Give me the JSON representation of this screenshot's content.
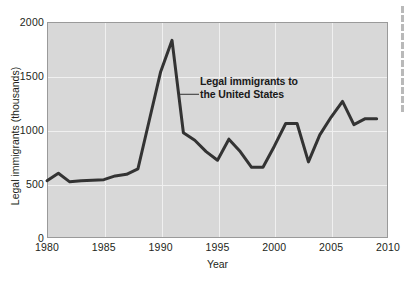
{
  "chart_data": {
    "type": "line",
    "title": "",
    "subtitle": "",
    "xlabel": "Year",
    "ylabel": "Legal immigrants (thousands)",
    "xlim": [
      1980,
      2010
    ],
    "ylim": [
      0,
      2000
    ],
    "grid": true,
    "legend": "none",
    "annotations": [
      {
        "text_line1": "Legal immigrants to",
        "text_line2": "the United States",
        "text": "Legal immigrants to the United States",
        "points_to_x": 1991.7,
        "points_to_y": 1330
      }
    ],
    "xticks": [
      "1980",
      "1985",
      "1990",
      "1995",
      "2000",
      "2005",
      "2010"
    ],
    "xtick_values": [
      1980,
      1985,
      1990,
      1995,
      2000,
      2005,
      2010
    ],
    "yticks": [
      "0",
      "500",
      "1000",
      "1500",
      "2000"
    ],
    "ytick_values": [
      0,
      500,
      1000,
      1500,
      2000
    ],
    "series": [
      {
        "name": "Legal immigrants to the United States",
        "color": "#333333",
        "x": [
          1980,
          1981,
          1982,
          1983,
          1984,
          1985,
          1986,
          1987,
          1988,
          1989,
          1990,
          1991,
          1992,
          1993,
          1994,
          1995,
          1996,
          1997,
          1998,
          1999,
          2000,
          2001,
          2002,
          2003,
          2004,
          2005,
          2006,
          2007,
          2008,
          2009
        ],
        "values": [
          530,
          600,
          520,
          530,
          535,
          540,
          575,
          590,
          640,
          1090,
          1540,
          1830,
          975,
          905,
          800,
          720,
          915,
          800,
          655,
          655,
          850,
          1060,
          1060,
          705,
          955,
          1120,
          1265,
          1050,
          1105,
          1105
        ]
      }
    ]
  },
  "colors": {
    "plot_background": "#d8d8d8",
    "gridline": "#f0f0f0",
    "frame": "#9a9a9a",
    "series": "#333333",
    "text": "#231f20",
    "page_background": "#ffffff"
  }
}
